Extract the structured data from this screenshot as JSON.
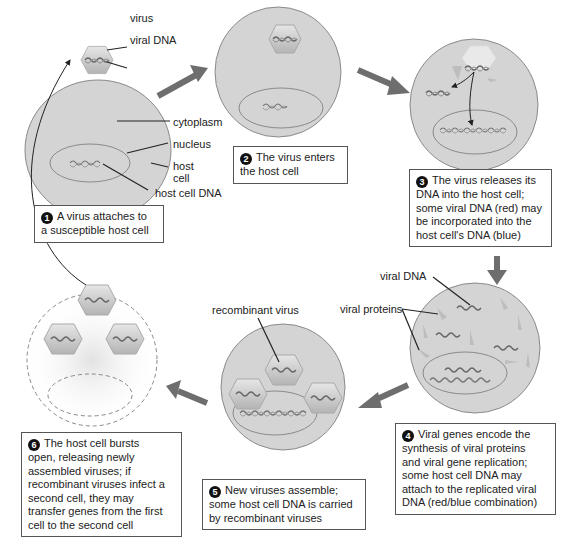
{
  "labels": {
    "virus": "virus",
    "viral_dna_top": "viral DNA",
    "cytoplasm": "cytoplasm",
    "nucleus": "nucleus",
    "host_cell": "host\ncell",
    "host_cell_dna": "host cell DNA",
    "viral_dna_step4": "viral DNA",
    "viral_proteins": "viral proteins",
    "recombinant_virus": "recombinant virus"
  },
  "steps": [
    {
      "number": "1",
      "text": "A virus attaches to\na susceptible host cell"
    },
    {
      "number": "2",
      "text": "The virus enters\nthe host cell"
    },
    {
      "number": "3",
      "text": "The virus releases its\nDNA into the host cell;\nsome viral DNA (red) may\nbe incorporated into the\nhost cell's DNA (blue)"
    },
    {
      "number": "4",
      "text": "Viral genes encode the\nsynthesis of viral proteins\nand viral gene replication;\nsome host cell DNA may\nattach to the replicated viral\nDNA (red/blue combination)"
    },
    {
      "number": "5",
      "text": "New viruses assemble;\nsome host cell DNA is carried\nby recombinant viruses"
    },
    {
      "number": "6",
      "text": "The host cell bursts\nopen, releasing newly\nassembled viruses; if\nrecombinant viruses infect a\nsecond cell, they may\ntransfer genes from the first\ncell to the second cell"
    }
  ],
  "colors": {
    "cell_fill": "#d4d4d4",
    "cell_stroke": "#8a8a8a",
    "arrow": "#6e6e6e",
    "virus_fill": "#c8c8c8"
  }
}
